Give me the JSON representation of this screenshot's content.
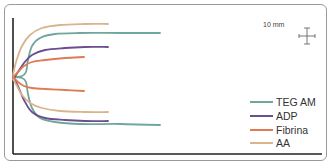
{
  "chart_data": {
    "type": "line",
    "title": "",
    "subtitle": "Thromboelastography platelet mapping tracings",
    "xlabel": "",
    "ylabel": "",
    "grid": false,
    "legend_position": "bottom-right",
    "scale_bar": {
      "label": "10 mm"
    },
    "origin": [
      13,
      77
    ],
    "series": [
      {
        "name": "TEG AM",
        "color": "#6fa79c",
        "upper": [
          [
            13,
            77
          ],
          [
            22,
            76
          ],
          [
            26,
            72
          ],
          [
            28,
            60
          ],
          [
            32,
            46
          ],
          [
            40,
            38
          ],
          [
            55,
            34
          ],
          [
            80,
            33
          ],
          [
            120,
            33
          ],
          [
            160,
            33
          ]
        ],
        "lower": [
          [
            13,
            77
          ],
          [
            22,
            78
          ],
          [
            26,
            82
          ],
          [
            28,
            94
          ],
          [
            32,
            108
          ],
          [
            40,
            118
          ],
          [
            55,
            122
          ],
          [
            80,
            124
          ],
          [
            120,
            124
          ],
          [
            160,
            125
          ]
        ]
      },
      {
        "name": "ADP",
        "color": "#6b4e8e",
        "upper": [
          [
            13,
            80
          ],
          [
            18,
            72
          ],
          [
            24,
            63
          ],
          [
            32,
            55
          ],
          [
            45,
            50
          ],
          [
            65,
            48
          ],
          [
            85,
            47
          ],
          [
            108,
            47
          ]
        ],
        "lower": [
          [
            13,
            76
          ],
          [
            18,
            86
          ],
          [
            24,
            100
          ],
          [
            32,
            112
          ],
          [
            45,
            118
          ],
          [
            65,
            120
          ],
          [
            85,
            121
          ],
          [
            108,
            121
          ]
        ]
      },
      {
        "name": "Fibrina",
        "color": "#e07a52",
        "upper": [
          [
            13,
            77
          ],
          [
            18,
            72
          ],
          [
            24,
            66
          ],
          [
            32,
            62
          ],
          [
            45,
            60
          ],
          [
            65,
            58
          ],
          [
            84,
            57
          ]
        ],
        "lower": [
          [
            13,
            77
          ],
          [
            18,
            82
          ],
          [
            24,
            86
          ],
          [
            32,
            88
          ],
          [
            45,
            89
          ],
          [
            65,
            90
          ],
          [
            84,
            91
          ]
        ]
      },
      {
        "name": "AA",
        "color": "#d9b48c",
        "upper": [
          [
            13,
            75
          ],
          [
            16,
            62
          ],
          [
            22,
            46
          ],
          [
            30,
            35
          ],
          [
            42,
            28
          ],
          [
            60,
            25
          ],
          [
            85,
            24
          ],
          [
            108,
            24
          ]
        ],
        "lower": [
          [
            13,
            79
          ],
          [
            17,
            86
          ],
          [
            22,
            95
          ],
          [
            30,
            103
          ],
          [
            42,
            108
          ],
          [
            60,
            111
          ],
          [
            85,
            112
          ],
          [
            108,
            112
          ]
        ]
      }
    ]
  },
  "legend": {
    "items": [
      {
        "label": "TEG AM",
        "color": "#6fa79c"
      },
      {
        "label": "ADP",
        "color": "#6b4e8e"
      },
      {
        "label": "Fibrina",
        "color": "#e07a52"
      },
      {
        "label": "AA",
        "color": "#d9b48c"
      }
    ]
  },
  "scale": {
    "label": "10 mm"
  },
  "colors": {
    "axis": "#222222",
    "frame": "#9a9a9a"
  }
}
